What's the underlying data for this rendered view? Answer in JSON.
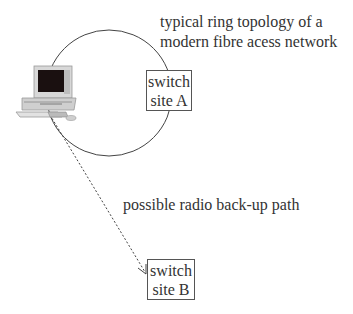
{
  "diagram": {
    "caption_ring": [
      "typical ring topology of a",
      "modern fibre acess network"
    ],
    "caption_radio": "possible radio back-up path",
    "nodes": [
      {
        "id": "switch_a",
        "lines": [
          "switch",
          "site A"
        ]
      },
      {
        "id": "switch_b",
        "lines": [
          "switch",
          "site B"
        ]
      },
      {
        "id": "computer",
        "icon": "desktop-computer-icon"
      }
    ],
    "edges": [
      {
        "from": "computer",
        "to": "switch_b",
        "style": "dashed",
        "arrow": true,
        "label": "possible radio back-up path"
      }
    ],
    "ring": {
      "shape": "circle",
      "members": [
        "computer",
        "switch_a"
      ]
    },
    "colors": {
      "line": "#444444",
      "text": "#333333",
      "screen": "#1a1010"
    }
  }
}
